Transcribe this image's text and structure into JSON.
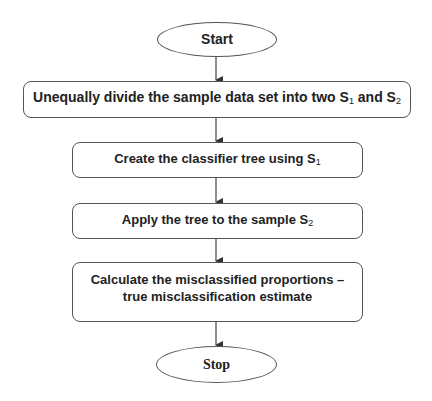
{
  "diagram": {
    "type": "flowchart",
    "direction": "top-to-bottom",
    "nodes": [
      {
        "id": "start",
        "shape": "oval",
        "label": "Start"
      },
      {
        "id": "step1",
        "shape": "rounded-rect",
        "label_prefix": "Unequally divide the sample data set into two S",
        "sub1": "1",
        "label_mid": " and S",
        "sub2": "2"
      },
      {
        "id": "step2",
        "shape": "rounded-rect",
        "label_prefix": "Create the classifier tree using S",
        "sub1": "1"
      },
      {
        "id": "step3",
        "shape": "rounded-rect",
        "label_prefix": "Apply the tree to the sample S",
        "sub1": "2"
      },
      {
        "id": "step4",
        "shape": "rounded-rect",
        "line1": "Calculate the misclassified proportions –",
        "line2": "true misclassification estimate"
      },
      {
        "id": "stop",
        "shape": "oval",
        "label": "Stop"
      }
    ],
    "edges": [
      {
        "from": "start",
        "to": "step1"
      },
      {
        "from": "step1",
        "to": "step2"
      },
      {
        "from": "step2",
        "to": "step3"
      },
      {
        "from": "step3",
        "to": "step4"
      },
      {
        "from": "step4",
        "to": "stop"
      }
    ],
    "colors": {
      "stroke": "#555555",
      "text": "#222222",
      "background": "#ffffff"
    }
  }
}
